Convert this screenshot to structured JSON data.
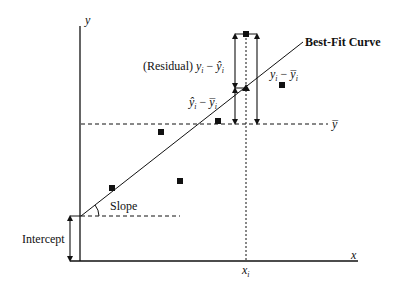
{
  "diagram": {
    "axes": {
      "x_label": "x",
      "y_label": "y",
      "xi_label": "x",
      "xi_sub": "i"
    },
    "labels": {
      "best_fit": "Best-Fit Curve",
      "residual_prefix": "(Residual) ",
      "residual_expr_a": "y",
      "residual_expr_b": "i",
      "residual_expr_minus": " − ",
      "residual_expr_c": "ŷ",
      "residual_expr_d": "i",
      "explained_a": "ŷ",
      "explained_b": "i",
      "explained_minus": " − ",
      "explained_c": "y̅",
      "explained_d": "i",
      "total_a": "y",
      "total_b": "i",
      "total_minus": " − ",
      "total_c": "y̅",
      "total_d": "i",
      "ybar": "y̅",
      "slope": "Slope",
      "intercept": "Intercept"
    },
    "data_points": [
      {
        "x": 112,
        "y": 188
      },
      {
        "x": 161,
        "y": 132
      },
      {
        "x": 180,
        "y": 181
      },
      {
        "x": 218,
        "y": 121
      },
      {
        "x": 282,
        "y": 85
      },
      {
        "x": 246,
        "y": 34
      }
    ],
    "predicted_point": {
      "x": 246,
      "y": 88
    },
    "colors": {
      "ink": "#111111",
      "background": "#ffffff"
    }
  }
}
